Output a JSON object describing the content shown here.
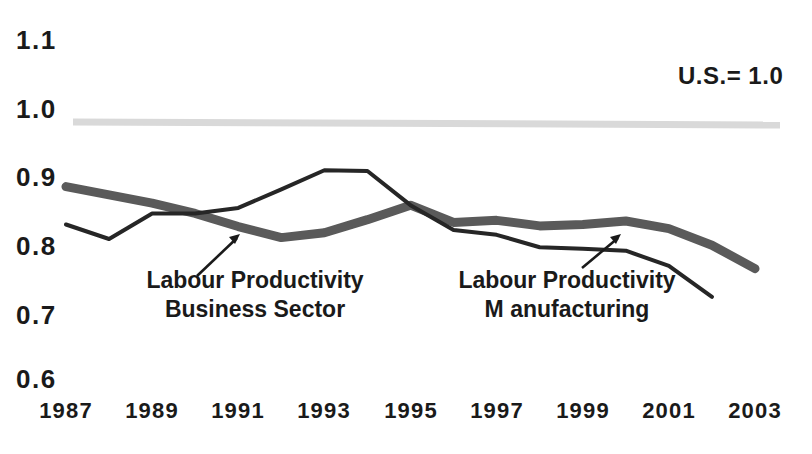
{
  "chart_data": {
    "type": "line",
    "title": "",
    "subtitle": "",
    "xlabel": "",
    "ylabel": "",
    "annotation_reference": "U.S.= 1.0",
    "grid": false,
    "legend_position": "inline-annotations",
    "xlim": [
      1987,
      2003
    ],
    "ylim": [
      0.6,
      1.1
    ],
    "x_tick_labels": [
      "1987",
      "1989",
      "1991",
      "1993",
      "1995",
      "1997",
      "1999",
      "2001",
      "2003"
    ],
    "x_tick_values": [
      1987,
      1989,
      1991,
      1993,
      1995,
      1997,
      1999,
      2001,
      2003
    ],
    "y_tick_labels": [
      "1.1",
      "1.0",
      "0.9",
      "0.8",
      "0.7",
      "0.6"
    ],
    "y_tick_values": [
      1.1,
      1.0,
      0.9,
      0.8,
      0.7,
      0.6
    ],
    "reference_line": {
      "label": "U.S.= 1.0",
      "value": 1.0,
      "color": "#d9d9d9"
    },
    "series": [
      {
        "name": "Labour Productivity Business Sector",
        "label_line1": "Labour Productivity",
        "label_line2": "Business Sector",
        "color": "#5a5a5a",
        "width": 9,
        "x": [
          1987,
          1988,
          1989,
          1990,
          1991,
          1992,
          1993,
          1994,
          1995,
          1996,
          1997,
          1998,
          1999,
          2000,
          2001,
          2002,
          2003
        ],
        "values": [
          0.905,
          0.893,
          0.881,
          0.866,
          0.847,
          0.831,
          0.838,
          0.857,
          0.878,
          0.853,
          0.856,
          0.848,
          0.85,
          0.855,
          0.844,
          0.82,
          0.786
        ]
      },
      {
        "name": "Labour Productivity Manufacturing",
        "label_line1": "Labour Productivity",
        "label_line2": "M anufacturing",
        "color": "#262626",
        "width": 4,
        "x": [
          1987,
          1988,
          1989,
          1990,
          1991,
          1992,
          1993,
          1994,
          1995,
          1996,
          1997,
          1998,
          1999,
          2000,
          2001,
          2002
        ],
        "values": [
          0.85,
          0.829,
          0.866,
          0.866,
          0.874,
          0.901,
          0.929,
          0.928,
          0.878,
          0.842,
          0.835,
          0.817,
          0.815,
          0.812,
          0.79,
          0.745
        ]
      }
    ]
  },
  "axis": {
    "y_ticks": [
      {
        "label": "1.1",
        "y": 39
      },
      {
        "label": "1.0",
        "y": 108
      },
      {
        "label": "0.9",
        "y": 176
      },
      {
        "label": "0.8",
        "y": 245
      },
      {
        "label": "0.7",
        "y": 314
      },
      {
        "label": "0.6",
        "y": 378
      }
    ],
    "x_ticks": [
      {
        "label": "1987",
        "x": 66
      },
      {
        "label": "1989",
        "x": 152
      },
      {
        "label": "1991",
        "x": 238
      },
      {
        "label": "1993",
        "x": 324
      },
      {
        "label": "1995",
        "x": 411
      },
      {
        "label": "1997",
        "x": 497
      },
      {
        "label": "1999",
        "x": 583
      },
      {
        "label": "2001",
        "x": 669
      },
      {
        "label": "2003",
        "x": 755
      }
    ]
  },
  "annotations": {
    "reference_note": "U.S.= 1.0",
    "business_sector": {
      "line1": "Labour Productivity",
      "line2": "Business Sector"
    },
    "manufacturing": {
      "line1": "Labour Productivity",
      "line2": "M anufacturing"
    }
  }
}
